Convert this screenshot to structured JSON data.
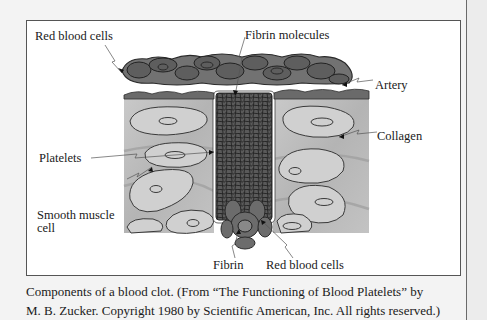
{
  "figure": {
    "labels": {
      "red_blood_cells_top": "Red blood cells",
      "fibrin_molecules": "Fibrin molecules",
      "artery": "Artery",
      "collagen": "Collagen",
      "platelets": "Platelets",
      "smooth_muscle_line1": "Smooth muscle",
      "smooth_muscle_line2": "cell",
      "fibrin": "Fibrin",
      "red_blood_cells_bottom": "Red blood cells"
    },
    "colors": {
      "rbc_fill": "#6f6f6f",
      "tissue_fill": "#bdbdbd",
      "cell_fill": "#cfcfcf",
      "clot_fill": "#555555",
      "outline": "#333333"
    }
  },
  "caption": {
    "line1": "Components of a blood clot. (From “The Functioning of Blood Platelets” by",
    "line2": "M. B. Zucker. Copyright 1980 by Scientific American, Inc. All rights reserved.)"
  }
}
